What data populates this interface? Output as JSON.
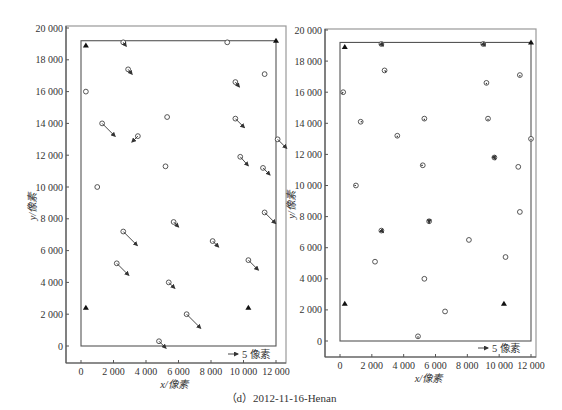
{
  "caption": "（d）2012-11-16-Henan",
  "chart_data": [
    {
      "type": "scatter",
      "title": "",
      "panel": "left",
      "xlabel": "x/像素",
      "ylabel": "y/像素",
      "xlim": [
        -800,
        12800
      ],
      "ylim": [
        -1000,
        20200
      ],
      "xticks": [
        0,
        2000,
        4000,
        6000,
        8000,
        10000,
        12000
      ],
      "xtick_labels": [
        "0",
        "2 000",
        "4 000",
        "6 000",
        "8 000",
        "10 000",
        "12 000"
      ],
      "yticks": [
        0,
        2000,
        4000,
        6000,
        8000,
        10000,
        12000,
        14000,
        16000,
        18000,
        20000
      ],
      "ytick_labels": [
        "0",
        "2 000",
        "4 000",
        "6 000",
        "8 000",
        "10 000",
        "12 000",
        "14 000",
        "16 000",
        "18 000",
        "20 000"
      ],
      "grid": false,
      "legend": {
        "label": "5 像素",
        "symbol": "arrow",
        "position": "lower right"
      },
      "image_boundary": {
        "x0": 0,
        "x1": 12000,
        "y0": 0,
        "y1": 19200
      },
      "control_points": [
        {
          "x": 300,
          "y": 18900
        },
        {
          "x": 12000,
          "y": 19200
        },
        {
          "x": 300,
          "y": 2400
        },
        {
          "x": 10300,
          "y": 2400
        }
      ],
      "check_points": [
        {
          "x": 2600,
          "y": 19100,
          "dx": 3,
          "dy": 4
        },
        {
          "x": 9000,
          "y": 19100,
          "dx": 0,
          "dy": 0
        },
        {
          "x": 2900,
          "y": 17400,
          "dx": 4,
          "dy": 5
        },
        {
          "x": 11300,
          "y": 17100,
          "dx": 0,
          "dy": 0
        },
        {
          "x": 9500,
          "y": 16600,
          "dx": 4,
          "dy": 5
        },
        {
          "x": 300,
          "y": 16000,
          "dx": 0,
          "dy": 0
        },
        {
          "x": 5300,
          "y": 14400,
          "dx": 0,
          "dy": 0
        },
        {
          "x": 1300,
          "y": 14000,
          "dx": 13,
          "dy": 13
        },
        {
          "x": 9500,
          "y": 14300,
          "dx": 9,
          "dy": 9
        },
        {
          "x": 3500,
          "y": 13200,
          "dx": -6,
          "dy": 6
        },
        {
          "x": 12100,
          "y": 13000,
          "dx": 9,
          "dy": 9
        },
        {
          "x": 9800,
          "y": 11900,
          "dx": 8,
          "dy": 9
        },
        {
          "x": 5200,
          "y": 11300,
          "dx": 0,
          "dy": 0
        },
        {
          "x": 11200,
          "y": 11200,
          "dx": 7,
          "dy": 7
        },
        {
          "x": 1000,
          "y": 10000,
          "dx": 0,
          "dy": 0
        },
        {
          "x": 11300,
          "y": 8400,
          "dx": 11,
          "dy": 11
        },
        {
          "x": 5700,
          "y": 7800,
          "dx": 5,
          "dy": 5
        },
        {
          "x": 2600,
          "y": 7200,
          "dx": 14,
          "dy": 14
        },
        {
          "x": 8100,
          "y": 6600,
          "dx": 6,
          "dy": 6
        },
        {
          "x": 10300,
          "y": 5400,
          "dx": 10,
          "dy": 10
        },
        {
          "x": 2200,
          "y": 5200,
          "dx": 12,
          "dy": 12
        },
        {
          "x": 5400,
          "y": 4000,
          "dx": 6,
          "dy": 6
        },
        {
          "x": 6500,
          "y": 2000,
          "dx": 14,
          "dy": 14
        },
        {
          "x": 4800,
          "y": 300,
          "dx": 7,
          "dy": 7
        }
      ]
    },
    {
      "type": "scatter",
      "title": "",
      "panel": "right",
      "xlabel": "x/像素",
      "ylabel": "y/像素",
      "xlim": [
        -800,
        12800
      ],
      "ylim": [
        -1000,
        20200
      ],
      "xticks": [
        0,
        2000,
        4000,
        6000,
        8000,
        10000,
        12000
      ],
      "xtick_labels": [
        "0",
        "2 000",
        "4 000",
        "6 000",
        "8 000",
        "10 000",
        "12 000"
      ],
      "yticks": [
        0,
        2000,
        4000,
        6000,
        8000,
        10000,
        12000,
        14000,
        16000,
        18000,
        20000
      ],
      "ytick_labels": [
        "0",
        "2 000",
        "4 000",
        "6 000",
        "8 000",
        "10 000",
        "12 000",
        "14 000",
        "16 000",
        "18 000",
        "20 000"
      ],
      "grid": false,
      "legend": {
        "label": "5 像素",
        "symbol": "arrow",
        "position": "lower right"
      },
      "image_boundary": {
        "x0": 0,
        "x1": 12000,
        "y0": 0,
        "y1": 19200
      },
      "control_points": [
        {
          "x": 300,
          "y": 18900
        },
        {
          "x": 12000,
          "y": 19200
        },
        {
          "x": 300,
          "y": 2400
        },
        {
          "x": 10300,
          "y": 2400
        }
      ],
      "check_points": [
        {
          "x": 2600,
          "y": 19100,
          "dx": 2,
          "dy": 2
        },
        {
          "x": 9000,
          "y": 19100,
          "dx": 2,
          "dy": 2
        },
        {
          "x": 2800,
          "y": 17400,
          "dx": 1,
          "dy": 1
        },
        {
          "x": 11300,
          "y": 17100,
          "dx": 0,
          "dy": 1
        },
        {
          "x": 9200,
          "y": 16600,
          "dx": 0,
          "dy": 1
        },
        {
          "x": 200,
          "y": 16000,
          "dx": -1,
          "dy": 1
        },
        {
          "x": 5300,
          "y": 14300,
          "dx": 0,
          "dy": 1
        },
        {
          "x": 1300,
          "y": 14100,
          "dx": 1,
          "dy": 0
        },
        {
          "x": 9300,
          "y": 14300,
          "dx": 0,
          "dy": 1
        },
        {
          "x": 3600,
          "y": 13200,
          "dx": 0,
          "dy": 1
        },
        {
          "x": 12000,
          "y": 13000,
          "dx": 0,
          "dy": 1
        },
        {
          "x": 9700,
          "y": 11800,
          "dx": 1,
          "dy": 2
        },
        {
          "x": 5200,
          "y": 11300,
          "dx": -1,
          "dy": 0
        },
        {
          "x": 11200,
          "y": 11200,
          "dx": 0,
          "dy": 0
        },
        {
          "x": 1000,
          "y": 10000,
          "dx": -1,
          "dy": 0
        },
        {
          "x": 11300,
          "y": 8300,
          "dx": 0,
          "dy": 0
        },
        {
          "x": 5600,
          "y": 7700,
          "dx": 0,
          "dy": 2
        },
        {
          "x": 2600,
          "y": 7100,
          "dx": 2,
          "dy": 2
        },
        {
          "x": 8100,
          "y": 6500,
          "dx": 0,
          "dy": 0
        },
        {
          "x": 10400,
          "y": 5400,
          "dx": 0,
          "dy": 0
        },
        {
          "x": 2200,
          "y": 5100,
          "dx": 0,
          "dy": 0
        },
        {
          "x": 5300,
          "y": 4000,
          "dx": 0,
          "dy": 0
        },
        {
          "x": 6600,
          "y": 1900,
          "dx": 0,
          "dy": 0
        },
        {
          "x": 4900,
          "y": 300,
          "dx": 0,
          "dy": 1
        }
      ]
    }
  ]
}
